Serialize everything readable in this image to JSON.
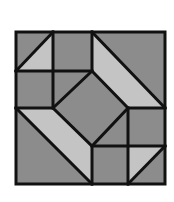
{
  "figure": {
    "type": "quilt-block-pattern",
    "colors": {
      "dark_fill": "#8c8c8c",
      "light_fill": "#c4c4c4",
      "outline": "#111111",
      "background": "#ffffff"
    },
    "grid": {
      "columns_x": [
        16,
        53,
        92,
        128,
        165
      ],
      "rows_y": [
        32,
        71,
        108,
        146,
        184
      ]
    },
    "pieces": [
      {
        "id": "tl-dark-triangle",
        "tone": "dark",
        "points": "16,32 53,32 16,71"
      },
      {
        "id": "tl-light-triangle",
        "tone": "light",
        "points": "53,32 53,71 16,71"
      },
      {
        "id": "top-square",
        "tone": "dark",
        "points": "53,32 92,32 92,71 53,71"
      },
      {
        "id": "tr-dark-triangle",
        "tone": "dark",
        "points": "92,32 165,32 165,108"
      },
      {
        "id": "tr-light-band",
        "tone": "light",
        "points": "92,32 165,108 128,108 92,71"
      },
      {
        "id": "left-square",
        "tone": "dark",
        "points": "16,71 53,71 53,108 16,108"
      },
      {
        "id": "center-nw-triangle",
        "tone": "dark",
        "points": "53,71 92,71 53,108"
      },
      {
        "id": "center-diamond",
        "tone": "dark",
        "points": "92,71 128,108 92,146 53,108"
      },
      {
        "id": "center-se-triangle",
        "tone": "dark",
        "points": "128,108 128,146 92,146"
      },
      {
        "id": "right-square",
        "tone": "dark",
        "points": "128,108 165,108 165,146 128,146"
      },
      {
        "id": "bl-light-band",
        "tone": "light",
        "points": "16,108 53,108 92,146 92,184"
      },
      {
        "id": "bl-dark-triangle",
        "tone": "dark",
        "points": "16,108 92,184 16,184"
      },
      {
        "id": "bottom-square",
        "tone": "dark",
        "points": "92,146 128,146 128,184 92,184"
      },
      {
        "id": "br-light-triangle",
        "tone": "light",
        "points": "128,146 165,146 128,184"
      },
      {
        "id": "br-dark-triangle",
        "tone": "dark",
        "points": "165,146 165,184 128,184"
      }
    ],
    "lines": [
      "16,32 165,32 165,184 16,184 16,32",
      "53,32 53,108",
      "92,32 92,71",
      "16,71 92,71",
      "16,108 53,108",
      "128,108 165,108",
      "128,108 128,184",
      "92,146 165,146",
      "92,146 92,184",
      "16,71 53,32",
      "92,32 165,108",
      "92,71 128,108 92,146 53,108 92,71",
      "16,108 92,184",
      "128,184 165,146"
    ]
  }
}
